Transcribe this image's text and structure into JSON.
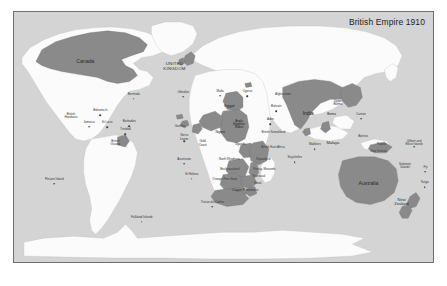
{
  "map": {
    "title": "British Empire 1910",
    "colors": {
      "ocean": "#d4d4d4",
      "land": "#fbfbfb",
      "empire": "#8a8a8a",
      "border": "#6f6f6f",
      "label": "#3a3a3a",
      "page_background": "#ffffff"
    },
    "labels": [
      {
        "text": "Canada",
        "x": 17.0,
        "y": 20.0,
        "cls": "big",
        "dot": false
      },
      {
        "text": "UNITED\nKINGDOM",
        "x": 38.3,
        "y": 22.0,
        "cls": "caps",
        "dot": false
      },
      {
        "text": "Bermuda",
        "x": 28.6,
        "y": 33.0,
        "cls": "",
        "dot": true
      },
      {
        "text": "Bahama Is",
        "x": 20.6,
        "y": 39.6,
        "cls": "",
        "dot": true
      },
      {
        "text": "British\nHonduras",
        "x": 13.6,
        "y": 41.6,
        "cls": "",
        "dot": false
      },
      {
        "text": "Jamaica",
        "x": 17.9,
        "y": 44.2,
        "cls": "",
        "dot": true
      },
      {
        "text": "St Lucia",
        "x": 22.2,
        "y": 44.4,
        "cls": "",
        "dot": true
      },
      {
        "text": "Barbados",
        "x": 27.5,
        "y": 44.1,
        "cls": "",
        "dot": true
      },
      {
        "text": "Trinidad",
        "x": 26.6,
        "y": 47.2,
        "cls": "",
        "dot": true
      },
      {
        "text": "British\nGuiana",
        "x": 24.2,
        "y": 52.2,
        "cls": "",
        "dot": false
      },
      {
        "text": "Gibraltar",
        "x": 40.4,
        "y": 32.3,
        "cls": "",
        "dot": true
      },
      {
        "text": "Malta",
        "x": 49.2,
        "y": 31.8,
        "cls": "",
        "dot": true
      },
      {
        "text": "Cyprus",
        "x": 55.7,
        "y": 32.0,
        "cls": "",
        "dot": true
      },
      {
        "text": "Egypt",
        "x": 51.4,
        "y": 37.6,
        "cls": "mid onemp",
        "dot": false
      },
      {
        "text": "Bahrain",
        "x": 62.6,
        "y": 38.0,
        "cls": "",
        "dot": true
      },
      {
        "text": "Afghanistan",
        "x": 64.2,
        "y": 33.2,
        "cls": "",
        "dot": false
      },
      {
        "text": "Anglo\nEgyptian\nSudan",
        "x": 53.7,
        "y": 45.0,
        "cls": "onemp",
        "dot": false
      },
      {
        "text": "Aden",
        "x": 61.2,
        "y": 43.2,
        "cls": "",
        "dot": true
      },
      {
        "text": "British Somaliland",
        "x": 61.9,
        "y": 48.3,
        "cls": "",
        "dot": false
      },
      {
        "text": "Gambia",
        "x": 39.6,
        "y": 45.8,
        "cls": "",
        "dot": false
      },
      {
        "text": "Sierra\nLeone",
        "x": 40.6,
        "y": 50.1,
        "cls": "",
        "dot": true
      },
      {
        "text": "Gold\nCoast",
        "x": 45.0,
        "y": 52.5,
        "cls": "",
        "dot": false
      },
      {
        "text": "Nigeria",
        "x": 49.2,
        "y": 48.3,
        "cls": "onemp",
        "dot": false
      },
      {
        "text": "Uganda",
        "x": 54.0,
        "y": 53.3,
        "cls": "",
        "dot": false
      },
      {
        "text": "British East Africa",
        "x": 61.8,
        "y": 54.2,
        "cls": "",
        "dot": false
      },
      {
        "text": "Ascension",
        "x": 40.6,
        "y": 59.0,
        "cls": "",
        "dot": true
      },
      {
        "text": "St Helena",
        "x": 42.4,
        "y": 65.0,
        "cls": "",
        "dot": true
      },
      {
        "text": "Seychelles",
        "x": 67.0,
        "y": 58.5,
        "cls": "",
        "dot": true
      },
      {
        "text": "Maldives",
        "x": 71.8,
        "y": 53.3,
        "cls": "",
        "dot": true
      },
      {
        "text": "North Rhodesia",
        "x": 51.4,
        "y": 59.3,
        "cls": "",
        "dot": false
      },
      {
        "text": "Nyasaland",
        "x": 59.5,
        "y": 59.2,
        "cls": "",
        "dot": false
      },
      {
        "text": "Bechuanaland",
        "x": 51.5,
        "y": 63.0,
        "cls": "",
        "dot": false
      },
      {
        "text": "Portug. Mozamb.",
        "x": 59.8,
        "y": 63.2,
        "cls": "",
        "dot": false
      },
      {
        "text": "Orange Free State",
        "x": 50.3,
        "y": 67.2,
        "cls": "",
        "dot": false
      },
      {
        "text": "Transvaal",
        "x": 58.4,
        "y": 65.8,
        "cls": "",
        "dot": false
      },
      {
        "text": "Natal",
        "x": 58.2,
        "y": 68.6,
        "cls": "",
        "dot": false
      },
      {
        "text": "Cape Province",
        "x": 55.2,
        "y": 71.0,
        "cls": "mid",
        "dot": false
      },
      {
        "text": "Tristan da Cunha",
        "x": 47.3,
        "y": 76.3,
        "cls": "",
        "dot": true
      },
      {
        "text": "Falkland Islands",
        "x": 30.5,
        "y": 82.2,
        "cls": "",
        "dot": true
      },
      {
        "text": "Pitcairn Island",
        "x": 9.6,
        "y": 67.1,
        "cls": "",
        "dot": true
      },
      {
        "text": "India",
        "x": 70.2,
        "y": 40.6,
        "cls": "big onemp",
        "dot": false
      },
      {
        "text": "Upper\nBurma",
        "x": 77.3,
        "y": 36.2,
        "cls": "",
        "dot": false
      },
      {
        "text": "Burma",
        "x": 75.8,
        "y": 41.2,
        "cls": "onemp",
        "dot": false
      },
      {
        "text": "Canton",
        "x": 82.8,
        "y": 41.0,
        "cls": "",
        "dot": true
      },
      {
        "text": "Malaya",
        "x": 76.1,
        "y": 52.3,
        "cls": "mid",
        "dot": false
      },
      {
        "text": "Borneo",
        "x": 83.3,
        "y": 50.0,
        "cls": "",
        "dot": false
      },
      {
        "text": "Papua",
        "x": 87.7,
        "y": 53.0,
        "cls": "",
        "dot": false
      },
      {
        "text": "New Guinea",
        "x": 87.0,
        "y": 56.0,
        "cls": "",
        "dot": false
      },
      {
        "text": "Gilbert and\nEllice Islands",
        "x": 95.5,
        "y": 52.2,
        "cls": "",
        "dot": true
      },
      {
        "text": "Solomon\nIslands",
        "x": 93.3,
        "y": 61.4,
        "cls": "",
        "dot": false
      },
      {
        "text": "Fiji",
        "x": 98.2,
        "y": 62.2,
        "cls": "",
        "dot": true
      },
      {
        "text": "Tonga",
        "x": 98.0,
        "y": 68.4,
        "cls": "",
        "dot": true
      },
      {
        "text": "Australia",
        "x": 84.6,
        "y": 68.8,
        "cls": "big",
        "dot": false
      },
      {
        "text": "New\nZealand",
        "x": 92.5,
        "y": 76.0,
        "cls": "mid",
        "dot": false
      }
    ]
  }
}
